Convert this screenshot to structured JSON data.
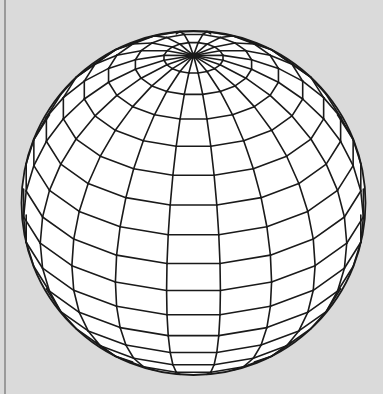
{
  "figure": {
    "background_color": "#dadada",
    "border_color": "#9a9a9a",
    "sphere_fill": "#ffffff",
    "line_color": "#1a1a1a",
    "center": [
      193.5,
      203
    ],
    "radius": 172,
    "tilt_deg": 31,
    "meridian_count": 20,
    "meridian_offset_deg": 9,
    "latitude_step_deg": 10
  }
}
